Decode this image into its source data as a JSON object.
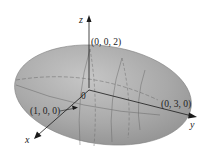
{
  "figure": {
    "shape": "ellipsoid",
    "axes": {
      "x": "x",
      "y": "y",
      "z": "z"
    },
    "origin_label": "0",
    "points": [
      {
        "label": "(0, 0, 2)"
      },
      {
        "label": "(1, 0, 0)"
      },
      {
        "label": "(0, 3, 0)"
      }
    ],
    "colors": {
      "surface": "#a3a3a3",
      "surface_light": "#c4c4c4",
      "outline": "#7a7a7a",
      "axis": "#1a1a1a"
    }
  }
}
